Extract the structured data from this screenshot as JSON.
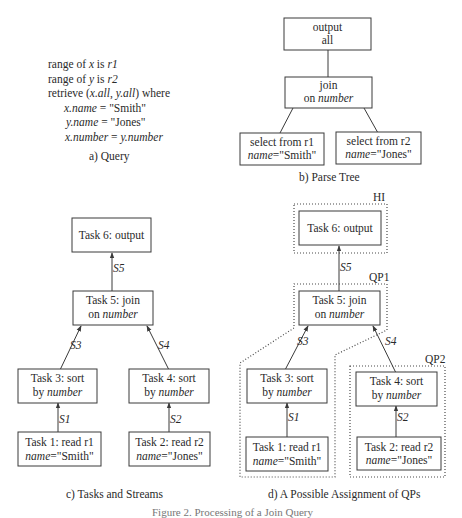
{
  "panel_a": {
    "lines": [
      {
        "pre": "range of ",
        "var": "x",
        "mid": " is ",
        "rel": "r1"
      },
      {
        "pre": "range of ",
        "var": "y",
        "mid": " is ",
        "rel": "r2"
      },
      {
        "pre": "retrieve (",
        "a": "x.all",
        "sep": ", ",
        "b": "y.all",
        "post": ") where"
      },
      {
        "lhs": "x.name",
        "op": " = ",
        "rhs": "\"Smith\""
      },
      {
        "lhs": "y.name",
        "op": " = ",
        "rhs": "\"Jones\""
      },
      {
        "lhs": "x.number",
        "op": " = ",
        "rhs_it": "y.number"
      }
    ],
    "caption": "a) Query"
  },
  "panel_b": {
    "nodes": {
      "output": {
        "line1": "output",
        "line2": "all"
      },
      "join": {
        "line1": "join",
        "line2_pre": "on ",
        "line2_it": "number"
      },
      "select1": {
        "line1": "select from r1",
        "line2_it": "name",
        "line2_rest": "=\"Smith\""
      },
      "select2": {
        "line1": "select from r2",
        "line2_it": "name",
        "line2_rest": "=\"Jones\""
      }
    },
    "caption": "b) Parse Tree"
  },
  "panel_c": {
    "tasks": {
      "t6": {
        "line1": "Task 6: output"
      },
      "t5": {
        "line1": "Task 5: join",
        "line2_pre": "on ",
        "line2_it": "number"
      },
      "t3": {
        "line1": "Task 3: sort",
        "line2_pre": "by ",
        "line2_it": "number"
      },
      "t4": {
        "line1": "Task 4: sort",
        "line2_pre": "by ",
        "line2_it": "number"
      },
      "t1": {
        "line1": "Task 1: read r1",
        "line2_it": "name",
        "line2_rest": "=\"Smith\""
      },
      "t2": {
        "line1": "Task 2: read r2",
        "line2_it": "name",
        "line2_rest": "=\"Jones\""
      }
    },
    "streams": {
      "s1": "S1",
      "s2": "S2",
      "s3": "S3",
      "s4": "S4",
      "s5": "S5"
    },
    "caption": "c) Tasks and Streams"
  },
  "panel_d": {
    "tasks": {
      "t6": {
        "line1": "Task 6: output"
      },
      "t5": {
        "line1": "Task 5: join",
        "line2_pre": "on ",
        "line2_it": "number"
      },
      "t3": {
        "line1": "Task 3: sort",
        "line2_pre": "by ",
        "line2_it": "number"
      },
      "t4": {
        "line1": "Task 4: sort",
        "line2_pre": "by ",
        "line2_it": "number"
      },
      "t1": {
        "line1": "Task 1: read r1",
        "line2_it": "name",
        "line2_rest": "=\"Smith\""
      },
      "t2": {
        "line1": "Task 2: read r2",
        "line2_it": "name",
        "line2_rest": "=\"Jones\""
      }
    },
    "streams": {
      "s1": "S1",
      "s2": "S2",
      "s3": "S3",
      "s4": "S4",
      "s5": "S5"
    },
    "groups": {
      "hi": "HI",
      "qp1": "QP1",
      "qp2": "QP2"
    },
    "caption": "d) A Possible Assignment of QPs"
  },
  "figure_caption": "Figure 2. Processing of a Join Query"
}
